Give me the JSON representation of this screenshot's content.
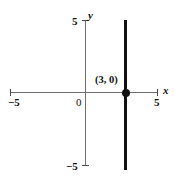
{
  "figure": {
    "title": "",
    "background_color": "#ffffff",
    "axis_color": "#6e6e6e",
    "curve_color": "#111111"
  },
  "labels": {
    "x_axis": "x",
    "y_axis": "y",
    "x_min_tick": "−5",
    "x_max_tick": "5",
    "y_max_tick": "5",
    "y_min_tick": "−5",
    "origin": "0",
    "point_label": "(3, 0)"
  },
  "chart_data": {
    "type": "line",
    "title": "",
    "xlabel": "x",
    "ylabel": "y",
    "xlim": [
      -5,
      5
    ],
    "ylim": [
      -5,
      5
    ],
    "grid": false,
    "legend": "none",
    "xticks": [
      -5,
      5
    ],
    "xticklabels": [
      "−5",
      "5"
    ],
    "yticks": [
      -5,
      5
    ],
    "yticklabels": [
      "−5",
      "5"
    ],
    "origin_label": "0",
    "series": [
      {
        "name": "x = 3",
        "equation": "x = 3",
        "description": "vertical line through x = 3",
        "x": [
          3,
          3
        ],
        "y": [
          -5,
          5
        ],
        "color": "#111111",
        "linewidth": 3
      }
    ],
    "annotations": [
      {
        "text": "(3, 0)",
        "x": 3,
        "y": 0,
        "marker": "filled-circle",
        "marker_color": "#111111"
      }
    ]
  }
}
